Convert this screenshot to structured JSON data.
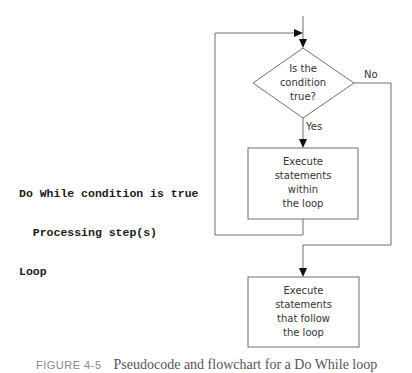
{
  "pseudocode": {
    "lines": [
      "Do While condition is true",
      "  Processing step(s)",
      "Loop"
    ]
  },
  "flowchart": {
    "decision": {
      "lines": [
        "Is the",
        "condition",
        "true?"
      ]
    },
    "yes_label": "Yes",
    "no_label": "No",
    "loop_body": {
      "lines": [
        "Execute",
        "statements",
        "within",
        "the loop"
      ]
    },
    "after_loop": {
      "lines": [
        "Execute",
        "statements",
        "that follow",
        "the loop"
      ]
    },
    "colors": {
      "line": "#6e6e6e",
      "arrow": "#111111",
      "text": "#333333"
    }
  },
  "caption": {
    "figure": "FIGURE 4-5",
    "text": "Pseudocode and flowchart for a Do While loop"
  }
}
